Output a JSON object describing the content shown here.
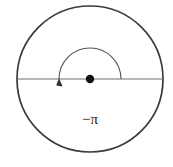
{
  "figure": {
    "type": "unit-circle-angle-diagram",
    "title": "",
    "background_color": "#ffffff",
    "canvas": {
      "width": 173,
      "height": 167
    },
    "circle": {
      "name": "main-circle",
      "center_x": 90,
      "center_y": 79,
      "radius": 73,
      "stroke_color": "#3b3b3b",
      "stroke_width": 1.7,
      "fill": "none"
    },
    "diameter_line": {
      "name": "horizontal-diameter",
      "x1": 17,
      "y1": 79,
      "x2": 163,
      "y2": 79,
      "stroke_color": "#6e6e6e",
      "stroke_width": 1.1
    },
    "center_point": {
      "name": "center-dot",
      "cx": 90,
      "cy": 79,
      "r": 4.2,
      "fill": "#111111"
    },
    "angle_arc": {
      "name": "negative-pi-arc",
      "radius": 31,
      "start_angle_degrees": 0,
      "end_angle_degrees": -180,
      "sweep_direction": "clockwise",
      "start_x": 121,
      "start_y": 79,
      "end_x": 59,
      "end_y": 79,
      "stroke_color": "#555555",
      "stroke_width": 1.1,
      "arrowhead": {
        "name": "arc-arrowhead",
        "tip_x": 59,
        "tip_y": 79,
        "size": 6,
        "fill": "#333333"
      }
    },
    "angle_label": {
      "name": "angle-value-label",
      "text": "−π",
      "value": "-pi",
      "numeric_value": -3.14159,
      "x": 90,
      "y": 124,
      "color": "#1a1a1a",
      "font_size": 15
    }
  },
  "chart_data": {
    "type": "scatter",
    "title": "",
    "subtitle": "",
    "xlabel": "",
    "ylabel": "",
    "annotations": [
      "−π"
    ],
    "series": [
      {
        "name": "terminal-angle",
        "angle_radians": -3.14159,
        "angle_degrees": -180,
        "label": "−π"
      }
    ],
    "x": [
      0
    ],
    "values": [
      -3.14159
    ],
    "categories": [
      "−π"
    ],
    "grid": false,
    "legend": "none"
  }
}
